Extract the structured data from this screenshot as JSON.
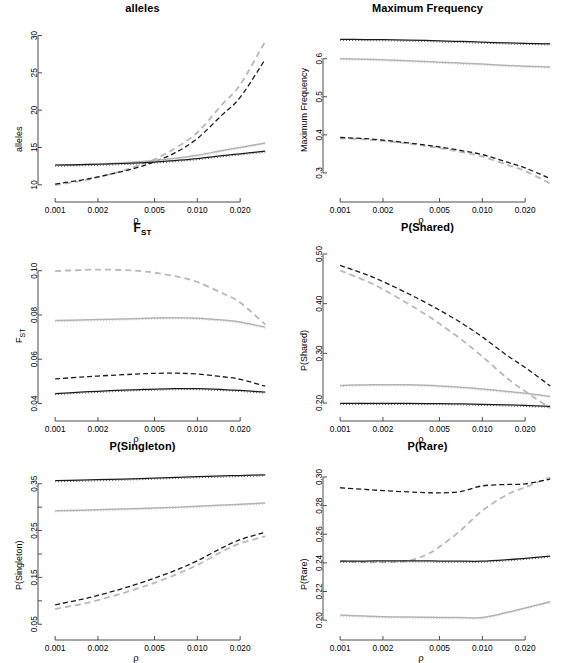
{
  "figure": {
    "width": 570,
    "height": 656,
    "background": "#ffffff",
    "layout": "2 columns x 3 rows of R base-graphics panels"
  },
  "axis": {
    "x_ticks": [
      "0.001",
      "0.002",
      "0.005",
      "0.010",
      "0.020"
    ],
    "x_tick_values": [
      0.001,
      0.002,
      0.005,
      0.01,
      0.02
    ],
    "x_label": "ρ",
    "x_scale": "log",
    "x_range": [
      0.00092,
      0.0335
    ]
  },
  "series_styles": [
    {
      "name": "black-solid",
      "color": "#1a1a1a",
      "dash": "none",
      "width": 1.25
    },
    {
      "name": "grey-solid",
      "color": "#b3b3b3",
      "dash": "none",
      "width": 1.5
    },
    {
      "name": "black-dashed",
      "color": "#1a1a1a",
      "dash": "5,3",
      "width": 1.3
    },
    {
      "name": "grey-dashed",
      "color": "#b9b9b9",
      "dash": "6,4",
      "width": 1.8
    },
    {
      "name": "black-dotted-overlay",
      "color": "#4d4d4d",
      "dash": "1,2",
      "width": 1
    },
    {
      "name": "grey-dotted-overlay",
      "color": "#c4c4c4",
      "dash": "1,2",
      "width": 1
    }
  ],
  "chart_data": [
    {
      "type": "line",
      "title": "alleles",
      "xlabel": "ρ",
      "ylabel": "alleles",
      "xscale": "log",
      "xlim": [
        0.00092,
        0.0335
      ],
      "ylim": [
        9.3,
        30.2
      ],
      "yticks": [
        10,
        15,
        20,
        25,
        30
      ],
      "ytick_labels": [
        "10",
        "15",
        "20",
        "25",
        "30"
      ],
      "grid": false,
      "legend": "none",
      "x": [
        0.001,
        0.0015,
        0.002,
        0.003,
        0.004,
        0.005,
        0.007,
        0.01,
        0.015,
        0.02,
        0.03
      ],
      "series": [
        {
          "name": "black-solid",
          "values": [
            12.65,
            12.7,
            12.75,
            12.85,
            12.95,
            13.05,
            13.25,
            13.5,
            13.9,
            14.15,
            14.5
          ]
        },
        {
          "name": "grey-solid",
          "values": [
            12.6,
            12.68,
            12.78,
            12.95,
            13.1,
            13.25,
            13.55,
            13.95,
            14.6,
            15.0,
            15.6
          ]
        },
        {
          "name": "black-dashed",
          "values": [
            10.1,
            10.6,
            11.05,
            11.8,
            12.45,
            13.1,
            14.3,
            16.2,
            19.4,
            21.7,
            26.8
          ]
        },
        {
          "name": "grey-dashed",
          "values": [
            9.95,
            10.5,
            11.0,
            11.9,
            12.7,
            13.4,
            14.9,
            17.0,
            20.8,
            23.4,
            29.2
          ]
        }
      ]
    },
    {
      "type": "line",
      "title": "Maximum Frequency",
      "xlabel": "ρ",
      "ylabel": "Maximum Frequency",
      "xscale": "log",
      "xlim": [
        0.00092,
        0.0335
      ],
      "ylim": [
        0.255,
        0.665
      ],
      "yticks": [
        0.3,
        0.4,
        0.5,
        0.6
      ],
      "ytick_labels": [
        "0.3",
        "0.4",
        "0.5",
        "0.6"
      ],
      "grid": false,
      "legend": "none",
      "x": [
        0.001,
        0.0015,
        0.002,
        0.003,
        0.004,
        0.005,
        0.007,
        0.01,
        0.015,
        0.02,
        0.03
      ],
      "series": [
        {
          "name": "black-solid",
          "values": [
            0.651,
            0.6505,
            0.65,
            0.649,
            0.648,
            0.647,
            0.6455,
            0.6435,
            0.6415,
            0.6405,
            0.639
          ]
        },
        {
          "name": "grey-solid",
          "values": [
            0.6,
            0.5985,
            0.597,
            0.5945,
            0.5925,
            0.591,
            0.5885,
            0.586,
            0.5825,
            0.5805,
            0.578
          ]
        },
        {
          "name": "black-dashed",
          "values": [
            0.393,
            0.39,
            0.386,
            0.379,
            0.373,
            0.368,
            0.359,
            0.348,
            0.328,
            0.313,
            0.285
          ]
        },
        {
          "name": "grey-dashed",
          "values": [
            0.391,
            0.388,
            0.384,
            0.377,
            0.371,
            0.365,
            0.355,
            0.343,
            0.321,
            0.305,
            0.272
          ]
        }
      ]
    },
    {
      "type": "line",
      "title": "F_ST",
      "title_display": "FST",
      "xlabel": "ρ",
      "ylabel": "F_ST",
      "xscale": "log",
      "xlim": [
        0.00092,
        0.0335
      ],
      "ylim": [
        0.0375,
        0.108
      ],
      "yticks": [
        0.04,
        0.06,
        0.08,
        0.1
      ],
      "ytick_labels": [
        "0.04",
        "0.06",
        "0.08",
        "0.10"
      ],
      "grid": false,
      "legend": "none",
      "x": [
        0.001,
        0.0015,
        0.002,
        0.003,
        0.004,
        0.005,
        0.007,
        0.01,
        0.015,
        0.02,
        0.03
      ],
      "series": [
        {
          "name": "black-solid",
          "values": [
            0.0445,
            0.0451,
            0.0455,
            0.046,
            0.0463,
            0.0465,
            0.0467,
            0.0467,
            0.0463,
            0.0459,
            0.0451
          ]
        },
        {
          "name": "grey-solid",
          "values": [
            0.0775,
            0.0777,
            0.0779,
            0.0782,
            0.0784,
            0.0786,
            0.0787,
            0.0785,
            0.0777,
            0.0768,
            0.0745
          ]
        },
        {
          "name": "black-dashed",
          "values": [
            0.0511,
            0.0519,
            0.0524,
            0.053,
            0.0534,
            0.0536,
            0.0537,
            0.0533,
            0.0521,
            0.0509,
            0.0478
          ]
        },
        {
          "name": "grey-dashed",
          "values": [
            0.0998,
            0.1003,
            0.1005,
            0.1003,
            0.0998,
            0.0991,
            0.0975,
            0.0949,
            0.0898,
            0.0856,
            0.0757
          ]
        }
      ]
    },
    {
      "type": "line",
      "title": "P(Shared)",
      "xlabel": "ρ",
      "ylabel": "P(Shared)",
      "xscale": "log",
      "xlim": [
        0.00092,
        0.0335
      ],
      "ylim": [
        0.188,
        0.502
      ],
      "yticks": [
        0.2,
        0.3,
        0.4,
        0.5
      ],
      "ytick_labels": [
        "0.20",
        "0.30",
        "0.40",
        "0.50"
      ],
      "grid": false,
      "legend": "none",
      "x": [
        0.001,
        0.0015,
        0.002,
        0.003,
        0.004,
        0.005,
        0.007,
        0.01,
        0.015,
        0.02,
        0.03
      ],
      "series": [
        {
          "name": "black-solid",
          "values": [
            0.1995,
            0.1995,
            0.1994,
            0.1992,
            0.199,
            0.1988,
            0.1983,
            0.1975,
            0.1962,
            0.1952,
            0.1935
          ]
        },
        {
          "name": "grey-solid",
          "values": [
            0.2355,
            0.2365,
            0.237,
            0.2366,
            0.2357,
            0.2345,
            0.2318,
            0.2282,
            0.2232,
            0.2198,
            0.2135
          ]
        },
        {
          "name": "black-dashed",
          "values": [
            0.477,
            0.4595,
            0.4445,
            0.4205,
            0.402,
            0.387,
            0.3625,
            0.333,
            0.2955,
            0.2715,
            0.2345
          ]
        },
        {
          "name": "grey-dashed",
          "values": [
            0.467,
            0.4465,
            0.429,
            0.4,
            0.378,
            0.3595,
            0.3295,
            0.2935,
            0.2495,
            0.2235,
            0.1895
          ]
        }
      ]
    },
    {
      "type": "line",
      "title": "P(Singleton)",
      "xlabel": "ρ",
      "ylabel": "P(Singleton)",
      "xscale": "log",
      "xlim": [
        0.00092,
        0.0335
      ],
      "ylim": [
        0.042,
        0.375
      ],
      "yticks": [
        0.05,
        0.15,
        0.25,
        0.35
      ],
      "ytick_labels": [
        "0.05",
        "0.15",
        "0.25",
        "0.35"
      ],
      "minor_yticks": [
        0.1,
        0.2,
        0.3
      ],
      "grid": false,
      "legend": "none",
      "x": [
        0.001,
        0.0015,
        0.002,
        0.003,
        0.004,
        0.005,
        0.007,
        0.01,
        0.015,
        0.02,
        0.03
      ],
      "series": [
        {
          "name": "black-solid",
          "values": [
            0.3565,
            0.3575,
            0.3585,
            0.36,
            0.361,
            0.362,
            0.3635,
            0.365,
            0.3665,
            0.3675,
            0.369
          ]
        },
        {
          "name": "grey-solid",
          "values": [
            0.2925,
            0.2935,
            0.2945,
            0.296,
            0.297,
            0.298,
            0.2998,
            0.3018,
            0.3045,
            0.306,
            0.309
          ]
        },
        {
          "name": "black-dashed",
          "values": [
            0.0915,
            0.1025,
            0.1115,
            0.1265,
            0.1385,
            0.1485,
            0.165,
            0.1855,
            0.2135,
            0.2305,
            0.2465
          ]
        },
        {
          "name": "grey-dashed",
          "values": [
            0.0825,
            0.0925,
            0.1015,
            0.1165,
            0.1285,
            0.1385,
            0.1555,
            0.1765,
            0.2055,
            0.2225,
            0.2375
          ]
        }
      ]
    },
    {
      "type": "line",
      "title": "P(Rare)",
      "xlabel": "ρ",
      "ylabel": "P(Rare)",
      "xscale": "log",
      "xlim": [
        0.00092,
        0.0335
      ],
      "ylim": [
        0.1945,
        0.3035
      ],
      "yticks": [
        0.2,
        0.22,
        0.24,
        0.26,
        0.28,
        0.3
      ],
      "ytick_labels": [
        "0.20",
        "0.22",
        "0.24",
        "0.26",
        "0.28",
        "0.30"
      ],
      "grid": false,
      "legend": "none",
      "x": [
        0.001,
        0.0015,
        0.002,
        0.003,
        0.004,
        0.005,
        0.007,
        0.01,
        0.015,
        0.02,
        0.03
      ],
      "series": [
        {
          "name": "black-solid",
          "values": [
            0.2412,
            0.2413,
            0.2414,
            0.2414,
            0.2414,
            0.2413,
            0.2412,
            0.2412,
            0.2422,
            0.2432,
            0.2448
          ]
        },
        {
          "name": "grey-solid",
          "values": [
            0.2035,
            0.2028,
            0.2024,
            0.2021,
            0.202,
            0.2019,
            0.2018,
            0.2018,
            0.2055,
            0.2085,
            0.2128
          ]
        },
        {
          "name": "black-dashed",
          "values": [
            0.2925,
            0.2913,
            0.2905,
            0.2896,
            0.2891,
            0.2889,
            0.2898,
            0.2938,
            0.2948,
            0.2952,
            0.2985
          ]
        },
        {
          "name": "grey-dashed",
          "values": [
            0.2412,
            0.2405,
            0.2404,
            0.2415,
            0.2455,
            0.2512,
            0.2625,
            0.2765,
            0.2878,
            0.2928,
            0.2998
          ]
        }
      ]
    }
  ]
}
